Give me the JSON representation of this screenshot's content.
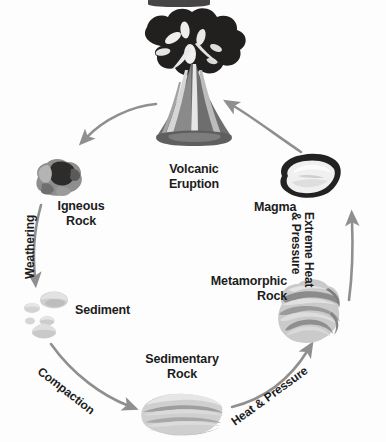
{
  "diagram": {
    "background_color": "#fdfdfd",
    "text_color": "#1c1c1c",
    "arrow_color": "#8c8c8c"
  },
  "stages": [
    {
      "id": "volcanic-eruption",
      "label_line1": "Volcanic",
      "label_line2": "Eruption",
      "icon": "volcano-icon"
    },
    {
      "id": "igneous-rock",
      "label_line1": "Igneous",
      "label_line2": "Rock",
      "icon": "igneous-rock-icon"
    },
    {
      "id": "sediment",
      "label_line1": "Sediment",
      "label_line2": "",
      "icon": "sediment-icon"
    },
    {
      "id": "sedimentary-rock",
      "label_line1": "Sedimentary",
      "label_line2": "Rock",
      "icon": "sedimentary-rock-icon"
    },
    {
      "id": "metamorphic-rock",
      "label_line1": "Metamorphic",
      "label_line2": "Rock",
      "icon": "metamorphic-rock-icon"
    },
    {
      "id": "magma",
      "label_line1": "Magma",
      "label_line2": "",
      "icon": "magma-icon"
    }
  ],
  "transitions": [
    {
      "id": "weathering",
      "label_line1": "Weathering",
      "label_line2": "",
      "from": "igneous-rock",
      "to": "sediment"
    },
    {
      "id": "compaction",
      "label_line1": "Compaction",
      "label_line2": "",
      "from": "sediment",
      "to": "sedimentary-rock"
    },
    {
      "id": "heat-and-pressure",
      "label_line1": "Heat & Pressure",
      "label_line2": "",
      "from": "sedimentary-rock",
      "to": "metamorphic-rock"
    },
    {
      "id": "extreme-heat-and-pressure",
      "label_line1": "Extreme Heat",
      "label_line2": "& Pressure",
      "from": "metamorphic-rock",
      "to": "magma"
    },
    {
      "id": "magma-to-eruption",
      "label_line1": "",
      "label_line2": "",
      "from": "magma",
      "to": "volcanic-eruption"
    },
    {
      "id": "eruption-to-igneous",
      "label_line1": "",
      "label_line2": "",
      "from": "volcanic-eruption",
      "to": "igneous-rock"
    }
  ]
}
